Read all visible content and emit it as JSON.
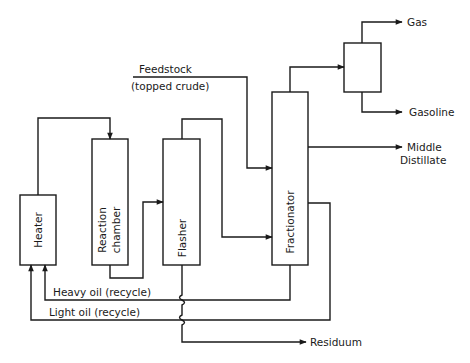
{
  "diagram": {
    "units": {
      "heater": "Heater",
      "reaction_chamber_line1": "Reaction",
      "reaction_chamber_line2": "chamber",
      "flasher": "Flasher",
      "fractionator": "Fractionator",
      "separator": ""
    },
    "streams": {
      "feedstock_line1": "Feedstock",
      "feedstock_line2": "(topped crude)",
      "gas": "Gas",
      "gasoline": "Gasoline",
      "middle_distillate_line1": "Middle",
      "middle_distillate_line2": "Distillate",
      "heavy_oil": "Heavy oil (recycle)",
      "light_oil": "Light oil (recycle)",
      "residuum": "Residuum"
    },
    "colors": {
      "stroke": "#1a1a1a",
      "background": "#ffffff"
    }
  }
}
